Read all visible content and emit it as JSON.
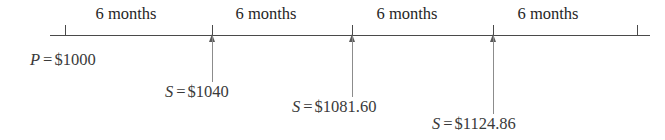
{
  "figure": {
    "axis": {
      "start_x": 50,
      "end_x": 650,
      "y": 35
    },
    "period_labels": [
      {
        "text": "6 months",
        "center_x": 126
      },
      {
        "text": "6 months",
        "center_x": 266
      },
      {
        "text": "6 months",
        "center_x": 407
      },
      {
        "text": "6 months",
        "center_x": 548
      }
    ],
    "end_ticks": [
      {
        "x": 65
      },
      {
        "x": 637
      }
    ],
    "markers": [
      {
        "x": 212,
        "stem_height": 46
      },
      {
        "x": 352,
        "stem_height": 61
      },
      {
        "x": 493,
        "stem_height": 78
      }
    ],
    "values": [
      {
        "symbol": "P",
        "equals": "=",
        "amount": "$1000",
        "x": 30,
        "y": 50
      },
      {
        "symbol": "S",
        "equals": "=",
        "amount": "$1040",
        "x": 165,
        "y": 82
      },
      {
        "symbol": "S",
        "equals": "=",
        "amount": "$1081.60",
        "x": 292,
        "y": 97
      },
      {
        "symbol": "S",
        "equals": "=",
        "amount": "$1124.86",
        "x": 432,
        "y": 114
      }
    ],
    "colors": {
      "axis": "#4a4a4a",
      "stem": "#8c8c8c",
      "text": "#3a3a3a",
      "background": "#ffffff"
    }
  }
}
